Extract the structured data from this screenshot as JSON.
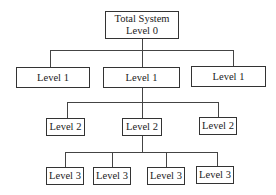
{
  "diagram": {
    "type": "hierarchy",
    "root": {
      "line1": "Total System",
      "line2": "Level 0"
    },
    "level1": [
      {
        "label": "Level 1"
      },
      {
        "label": "Level 1"
      },
      {
        "label": "Level 1"
      }
    ],
    "level2": [
      {
        "label": "Level 2"
      },
      {
        "label": "Level 2"
      },
      {
        "label": "Level 2"
      }
    ],
    "level3": [
      {
        "label": "Level 3"
      },
      {
        "label": "Level 3"
      },
      {
        "label": "Level 3"
      },
      {
        "label": "Level 3"
      }
    ],
    "colors": {
      "line": "#444444",
      "border": "#333333",
      "background": "#ffffff"
    }
  }
}
